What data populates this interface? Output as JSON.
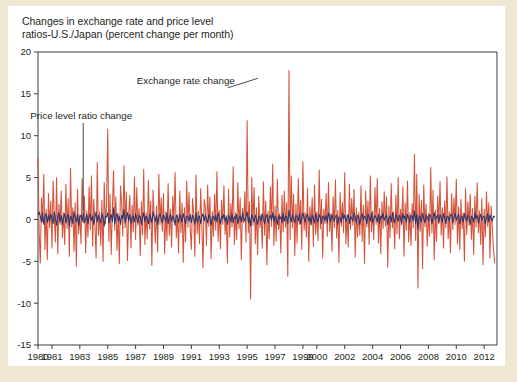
{
  "figure": {
    "title_line1": "Changes in exchange rate and price level",
    "title_line2": "ratios-U.S./Japan (percent change per month)",
    "background_color": "#efe7d2",
    "card_color": "#ffffff"
  },
  "annotations": {
    "exchange_rate": "Exchange rate change",
    "price_level": "Price level ratio change"
  },
  "chart_data": {
    "type": "line",
    "title": "Changes in exchange rate and price level ratios-U.S./Japan (percent change per month)",
    "xlabel": "",
    "ylabel": "",
    "ylim": [
      -15,
      20
    ],
    "xlim": [
      1980.0,
      2012.92
    ],
    "yticks": [
      20,
      15,
      10,
      5,
      0,
      -5,
      -10,
      -15
    ],
    "ytick_labels": [
      "20",
      "15",
      "10",
      "5",
      "0",
      "-5",
      "-10",
      "-15"
    ],
    "xticks": [
      1980,
      1981,
      1983,
      1985,
      1987,
      1989,
      1991,
      1993,
      1995,
      1997,
      1999,
      2000,
      2002,
      2004,
      2006,
      2008,
      2010,
      2012
    ],
    "xtick_labels": [
      "1980",
      "1981",
      "1983",
      "1985",
      "1987",
      "1989",
      "1991",
      "1993",
      "1995",
      "1997",
      "1999",
      "2000",
      "2002",
      "2004",
      "2006",
      "2008",
      "2010",
      "2012"
    ],
    "grid": false,
    "legend": "annotated-inline",
    "colors": {
      "exchange_rate": "#d4533a",
      "price_level": "#27356e"
    },
    "series": [
      {
        "name": "Exchange rate change",
        "color": "#d4533a",
        "x_start": 1980.0,
        "x_step": 0.0833333,
        "values": [
          7.3,
          -1.4,
          -5.2,
          2.6,
          -0.3,
          5.4,
          -3.6,
          1.2,
          -4.8,
          3.1,
          -1.0,
          2.2,
          -3.4,
          4.6,
          0.4,
          -2.7,
          5.0,
          -4.1,
          1.8,
          -0.6,
          3.4,
          -2.2,
          0.8,
          -3.0,
          4.2,
          -1.1,
          2.5,
          -4.4,
          6.1,
          -0.9,
          1.4,
          -3.8,
          2.0,
          -5.6,
          3.6,
          -1.7,
          0.6,
          -2.9,
          4.9,
          -0.4,
          2.8,
          -4.0,
          1.0,
          -2.1,
          3.9,
          -1.2,
          5.2,
          -3.2,
          2.4,
          -0.8,
          -4.6,
          6.8,
          -1.9,
          0.9,
          -3.1,
          2.3,
          -5.0,
          4.4,
          -0.5,
          1.6,
          10.8,
          -2.6,
          3.0,
          -4.2,
          1.1,
          5.8,
          -1.3,
          2.7,
          -3.7,
          0.7,
          -5.3,
          4.0,
          1.9,
          -2.0,
          6.4,
          -1.0,
          3.3,
          -4.9,
          0.5,
          2.9,
          -3.4,
          1.7,
          -1.5,
          5.1,
          -2.4,
          3.8,
          -0.7,
          1.3,
          -4.3,
          2.1,
          -1.8,
          6.0,
          -3.0,
          0.8,
          -2.3,
          4.7,
          -1.1,
          2.2,
          -5.5,
          3.5,
          0.4,
          -2.8,
          1.6,
          -3.9,
          5.4,
          -0.6,
          2.6,
          -1.4,
          3.1,
          -4.1,
          0.9,
          -2.5,
          4.3,
          -1.9,
          1.2,
          -3.3,
          2.8,
          -0.3,
          5.6,
          -2.2,
          0.6,
          -4.0,
          3.4,
          -1.6,
          2.0,
          -5.1,
          1.4,
          -2.7,
          4.6,
          -0.9,
          3.2,
          -1.2,
          -3.6,
          2.5,
          0.7,
          -4.4,
          5.3,
          -1.7,
          1.0,
          -2.9,
          3.7,
          -0.5,
          -5.8,
          2.4,
          1.5,
          -3.1,
          4.1,
          -0.8,
          2.7,
          -4.7,
          0.9,
          -2.0,
          3.0,
          -1.3,
          5.7,
          -2.6,
          1.1,
          -3.5,
          2.3,
          -0.6,
          4.0,
          -1.8,
          0.5,
          -5.2,
          3.6,
          -2.1,
          1.9,
          -0.9,
          6.3,
          -3.0,
          0.8,
          -2.4,
          4.4,
          -1.1,
          2.6,
          -4.8,
          1.3,
          -0.4,
          3.3,
          -2.7,
          11.8,
          -1.6,
          2.1,
          -9.5,
          5.0,
          -0.7,
          3.8,
          -2.9,
          1.4,
          -4.2,
          2.8,
          -1.0,
          0.6,
          -3.4,
          4.5,
          -1.9,
          2.2,
          -5.4,
          1.0,
          -2.3,
          3.9,
          -0.8,
          6.6,
          -3.1,
          1.6,
          -2.6,
          4.8,
          -1.2,
          0.7,
          -4.0,
          2.9,
          -1.5,
          3.4,
          -0.9,
          2.0,
          -6.8,
          17.8,
          -2.4,
          5.2,
          -1.0,
          3.0,
          -4.3,
          1.8,
          -2.8,
          4.9,
          -0.6,
          2.3,
          -3.6,
          6.9,
          -1.3,
          0.8,
          -2.1,
          3.7,
          -5.0,
          1.5,
          -0.7,
          2.6,
          -3.2,
          4.1,
          -1.8,
          0.9,
          -2.5,
          5.9,
          -1.1,
          2.4,
          -4.6,
          1.2,
          -0.5,
          3.1,
          -2.0,
          4.4,
          -1.4,
          0.7,
          -3.8,
          2.7,
          -1.0,
          4.7,
          -2.2,
          1.1,
          -5.1,
          3.2,
          -0.8,
          2.0,
          -1.6,
          5.6,
          -2.9,
          0.6,
          -3.3,
          4.2,
          -1.2,
          2.5,
          -0.7,
          3.6,
          -4.5,
          1.4,
          -2.1,
          0.8,
          -1.9,
          4.0,
          -2.6,
          1.7,
          -5.3,
          3.4,
          -0.9,
          2.2,
          -3.0,
          5.2,
          -1.5,
          1.0,
          -2.4,
          3.8,
          -0.6,
          4.9,
          -2.8,
          1.3,
          -4.1,
          2.1,
          -1.1,
          3.3,
          -0.8,
          2.7,
          -5.7,
          1.6,
          -2.2,
          4.3,
          -1.0,
          0.9,
          -3.5,
          2.9,
          -1.7,
          5.0,
          -2.3,
          1.2,
          -0.7,
          3.9,
          -4.4,
          2.0,
          -1.3,
          4.6,
          -2.7,
          0.8,
          -3.1,
          1.9,
          -1.0,
          7.8,
          -2.5,
          5.4,
          -8.2,
          3.0,
          -1.4,
          2.3,
          -5.9,
          4.1,
          -0.9,
          1.8,
          -3.2,
          0.7,
          -2.0,
          6.2,
          -1.6,
          3.5,
          -4.8,
          1.1,
          -2.6,
          2.8,
          -0.5,
          4.5,
          -1.9,
          1.4,
          -3.4,
          2.2,
          -1.0,
          5.1,
          -2.3,
          0.9,
          -4.0,
          3.1,
          -1.2,
          2.6,
          -0.6,
          4.8,
          -2.9,
          1.5,
          -3.6,
          2.4,
          -1.1,
          0.8,
          -5.0,
          3.7,
          -1.8,
          2.1,
          -0.7,
          3.0,
          -2.4,
          1.3,
          -4.2,
          2.8,
          -0.9,
          4.4,
          -1.6,
          1.0,
          -3.0,
          2.5,
          -5.4,
          1.2,
          -2.1,
          3.3,
          -0.8,
          2.0,
          -4.6,
          1.6,
          -1.0,
          -3.5,
          -5.2
        ]
      },
      {
        "name": "Price level ratio change",
        "color": "#27356e",
        "x_start": 1980.0,
        "x_step": 0.0833333,
        "values": [
          0.6,
          0.9,
          0.4,
          -0.3,
          0.8,
          -0.6,
          0.3,
          0.7,
          -0.4,
          0.5,
          -0.2,
          0.6,
          0.2,
          -0.5,
          0.9,
          0.1,
          -0.7,
          0.4,
          0.8,
          -0.3,
          0.5,
          -0.6,
          0.2,
          0.7,
          -0.4,
          0.3,
          0.6,
          -0.8,
          0.4,
          0.1,
          -0.5,
          0.9,
          0.2,
          -0.3,
          0.6,
          -0.7,
          0.3,
          0.5,
          -0.2,
          0.8,
          -0.4,
          0.1,
          0.6,
          -0.5,
          0.3,
          0.7,
          -0.1,
          0.4,
          -0.6,
          0.2,
          0.9,
          -0.3,
          0.5,
          0.1,
          -0.4,
          0.7,
          0.2,
          -0.8,
          0.4,
          0.3,
          0.8,
          -0.4,
          0.2,
          0.6,
          -0.3,
          1.4,
          -0.5,
          0.3,
          0.7,
          -0.2,
          0.4,
          -0.6,
          0.5,
          0.1,
          1.2,
          -0.4,
          0.3,
          0.8,
          -0.2,
          0.6,
          -0.5,
          0.2,
          0.4,
          -0.3,
          0.7,
          0.1,
          -0.4,
          0.5,
          0.3,
          -0.6,
          0.2,
          0.8,
          -0.3,
          0.4,
          0.1,
          -0.5,
          0.6,
          0.2,
          -0.4,
          0.9,
          0.3,
          -0.2,
          0.5,
          -0.6,
          0.3,
          0.7,
          0.1,
          -0.4,
          0.5,
          0.2,
          -0.3,
          0.8,
          -0.5,
          0.3,
          0.6,
          -0.2,
          0.4,
          0.1,
          -0.7,
          0.5,
          0.3,
          -0.4,
          0.6,
          0.2,
          -0.3,
          0.7,
          0.1,
          -0.5,
          0.4,
          0.3,
          -0.2,
          0.6,
          -0.4,
          0.5,
          0.2,
          -0.6,
          0.8,
          -0.3,
          0.1,
          0.4,
          -0.5,
          0.3,
          0.7,
          -0.2,
          0.5,
          0.1,
          -0.4,
          0.6,
          0.2,
          -0.7,
          0.3,
          0.4,
          -0.1,
          0.5,
          -0.3,
          0.8,
          0.2,
          -0.5,
          0.4,
          0.1,
          0.6,
          -0.2,
          0.3,
          -0.6,
          0.5,
          0.2,
          -0.3,
          0.7,
          -0.4,
          0.3,
          0.1,
          0.6,
          -0.5,
          0.2,
          0.4,
          -0.3,
          0.8,
          0.1,
          -0.2,
          0.5,
          0.9,
          -0.4,
          0.3,
          -0.8,
          0.6,
          0.2,
          -0.3,
          0.5,
          0.1,
          -0.6,
          0.4,
          0.3,
          -0.2,
          0.7,
          0.1,
          -0.5,
          0.3,
          0.6,
          -0.4,
          0.2,
          0.5,
          -0.1,
          0.8,
          -0.3,
          0.4,
          0.2,
          -0.6,
          0.5,
          0.1,
          0.3,
          -0.4,
          0.7,
          -0.2,
          0.4,
          0.3,
          -0.5,
          1.1,
          0.2,
          -0.3,
          0.6,
          0.1,
          -0.4,
          0.5,
          0.3,
          -0.2,
          0.7,
          -0.5,
          0.2,
          0.8,
          0.1,
          -0.3,
          0.4,
          0.6,
          -0.2,
          0.3,
          -0.6,
          0.5,
          0.2,
          -0.4,
          0.7,
          0.1,
          -0.3,
          0.6,
          0.2,
          -0.5,
          0.4,
          0.3,
          -0.1,
          0.5,
          -0.4,
          0.8,
          0.2,
          -0.3,
          0.6,
          0.1,
          -0.2,
          0.4,
          0.5,
          -0.6,
          0.3,
          0.2,
          -0.4,
          0.7,
          0.1,
          0.5,
          -0.3,
          0.2,
          0.6,
          -0.5,
          0.4,
          0.1,
          -0.2,
          0.8,
          0.3,
          -0.4,
          0.5,
          0.2,
          -0.6,
          0.3,
          0.7,
          -0.1,
          0.4,
          0.2,
          -0.5,
          0.6,
          0.3,
          -0.2,
          0.8,
          -0.4,
          0.1,
          0.5,
          0.2,
          -0.3,
          0.6,
          -0.5,
          0.4,
          0.2,
          0.7,
          -0.1,
          0.3,
          0.5,
          -0.6,
          0.2,
          0.4,
          -0.3,
          0.8,
          0.1,
          -0.4,
          0.6,
          0.3,
          -0.2,
          0.5,
          0.2,
          -0.5,
          0.7,
          0.1,
          0.4,
          -0.3,
          0.6,
          0.2,
          -0.4,
          0.5,
          0.3,
          -0.1,
          1.0,
          -0.5,
          0.6,
          -1.2,
          0.4,
          0.2,
          -0.3,
          0.7,
          0.1,
          -0.4,
          0.5,
          0.3,
          -0.2,
          0.6,
          0.4,
          -0.5,
          0.2,
          0.8,
          -0.1,
          0.3,
          0.5,
          -0.4,
          0.6,
          0.2,
          -0.3,
          0.7,
          0.1,
          -0.5,
          0.4,
          0.3,
          -0.2,
          0.6,
          0.5,
          -0.4,
          0.2,
          0.8,
          -0.1,
          0.3,
          0.6,
          -0.5,
          0.2,
          0.4,
          -0.3,
          0.7,
          0.1,
          -0.2,
          0.5,
          0.3,
          -0.6,
          0.4,
          0.2,
          -0.3,
          0.8,
          0.1,
          0.5,
          -0.4,
          0.2,
          0.6,
          -0.1,
          0.3,
          0.4,
          -0.5,
          0.2,
          0.7,
          -0.3,
          0.5,
          0.1,
          -0.2,
          0.4,
          0.3
        ]
      }
    ],
    "annotations": [
      {
        "text": "Exchange rate change",
        "x": 1990.6,
        "y": 16.2
      },
      {
        "text": "Price level ratio change",
        "x": 1983.1,
        "y": 12.0
      }
    ]
  }
}
